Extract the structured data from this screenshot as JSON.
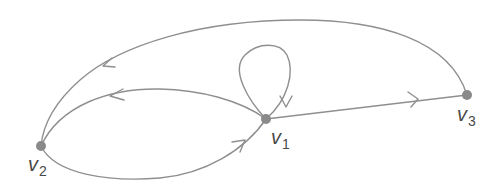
{
  "diagram": {
    "type": "directed-graph",
    "colors": {
      "edge": "#8f8f8f",
      "node": "#8a8a8a",
      "label": "#4a4a4a",
      "background": "#ffffff"
    },
    "nodes": [
      {
        "id": "v1",
        "base": "v",
        "sub": "1"
      },
      {
        "id": "v2",
        "base": "v",
        "sub": "2"
      },
      {
        "id": "v3",
        "base": "v",
        "sub": "3"
      }
    ],
    "edges": [
      {
        "from": "v3",
        "to": "v2",
        "shape": "large-arc-top"
      },
      {
        "from": "v1",
        "to": "v2",
        "shape": "upper-arc"
      },
      {
        "from": "v2",
        "to": "v1",
        "shape": "lower-arc"
      },
      {
        "from": "v1",
        "to": "v1",
        "shape": "loop"
      },
      {
        "from": "v1",
        "to": "v3",
        "shape": "straight"
      }
    ]
  }
}
